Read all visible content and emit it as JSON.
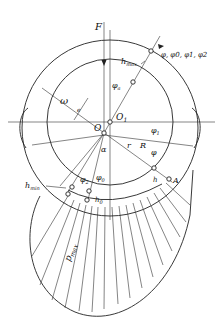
{
  "diagram": {
    "type": "journal bearing pressure distribution",
    "labels": {
      "force": "F",
      "h_max": "h",
      "h_max_sub": "max",
      "angles_list": "φ, φ0, φ1, φ2",
      "phi_a": "φ",
      "phi_a_sub": "a",
      "omega": "ω",
      "e": "e",
      "O1": "O",
      "O1_sub": "1",
      "O": "O",
      "phi1": "φ",
      "phi1_sub": "1",
      "alpha": "α",
      "r": "r",
      "R": "R",
      "phi": "φ",
      "h_min": "h",
      "h_min_sub": "min",
      "phi2": "φ",
      "phi2_sub": "2",
      "phi0": "φ",
      "phi0_sub": "0",
      "h0": "h",
      "h0_sub": "0",
      "h": "h",
      "A": "A",
      "p_max": "p",
      "p_max_sub": "max"
    }
  }
}
